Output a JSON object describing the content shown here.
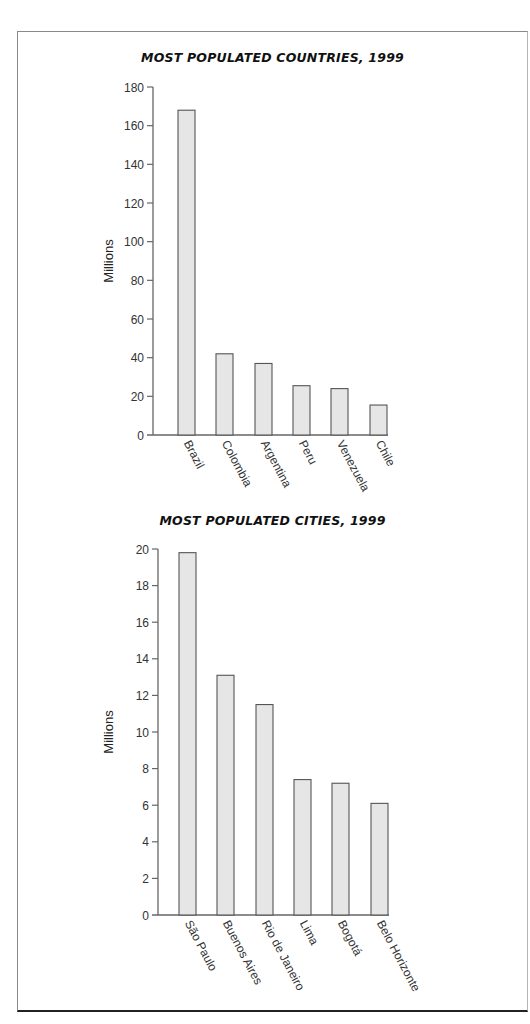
{
  "chart_data": [
    {
      "type": "bar",
      "title": "MOST POPULATED COUNTRIES, 1999",
      "xlabel": "",
      "ylabel": "Millions",
      "ylim": [
        0,
        180
      ],
      "yticks": [
        0,
        20,
        40,
        60,
        80,
        100,
        120,
        140,
        160,
        180
      ],
      "grid": false,
      "categories": [
        "Brazil",
        "Colombia",
        "Argentina",
        "Peru",
        "Venezuela",
        "Chile"
      ],
      "values": [
        168,
        42,
        37,
        25.5,
        24,
        15.5
      ],
      "bar_color": "#e6e6e6",
      "bar_edge_color": "#555555"
    },
    {
      "type": "bar",
      "title": "MOST POPULATED CITIES, 1999",
      "xlabel": "",
      "ylabel": "Millions",
      "ylim": [
        0,
        20
      ],
      "yticks": [
        0,
        2,
        4,
        6,
        8,
        10,
        12,
        14,
        16,
        18,
        20
      ],
      "grid": false,
      "categories": [
        "São Paulo",
        "Buenos Aires",
        "Rio de Janeiro",
        "Lima",
        "Bogotá",
        "Belo Horizonte"
      ],
      "values": [
        19.8,
        13.1,
        11.5,
        7.4,
        7.2,
        6.1
      ],
      "bar_color": "#e6e6e6",
      "bar_edge_color": "#555555"
    }
  ]
}
